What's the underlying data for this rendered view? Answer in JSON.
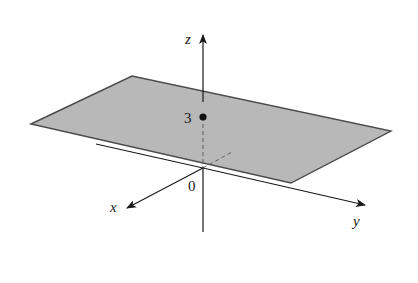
{
  "figure": {
    "colors": {
      "plane_fill": "#b8b8b8",
      "plane_edge": "#4a4a4a",
      "axis": "#1a1a1a",
      "background": "#ffffff"
    },
    "axes": {
      "x": {
        "label": "x"
      },
      "y": {
        "label": "y"
      },
      "z": {
        "label": "z"
      }
    },
    "origin_label": "0",
    "point": {
      "label": "3",
      "z_value": 3
    },
    "plane": {
      "equation": "z = 3",
      "vertices_px": [
        [
          31,
          124
        ],
        [
          132,
          76
        ],
        [
          391,
          131
        ],
        [
          291,
          183
        ]
      ]
    }
  }
}
